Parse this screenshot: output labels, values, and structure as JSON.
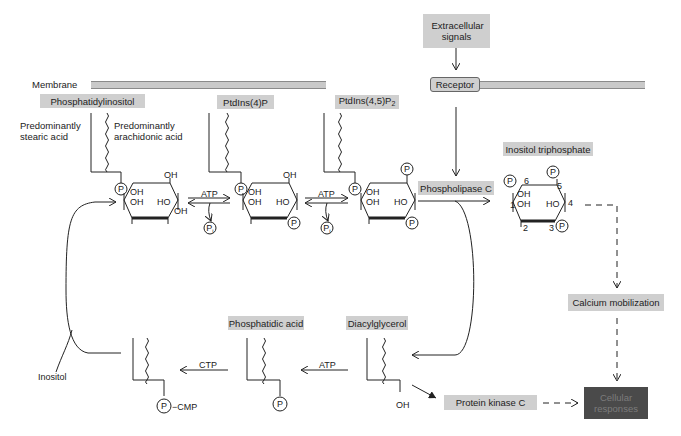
{
  "membrane": {
    "label": "Membrane"
  },
  "extracellular": {
    "label": "Extracellular signals"
  },
  "receptor": {
    "label": "Receptor"
  },
  "molecules": {
    "pi": {
      "label": "Phosphatidylinositol",
      "left_chain": "Predominantly stearic acid",
      "right_chain": "Predominantly arachidonic acid"
    },
    "pip": {
      "label": "PtdIns(4)P"
    },
    "pip2": {
      "label": "PtdIns(4,5)P",
      "subscript": "2"
    },
    "ip3": {
      "label": "Inositol triphosphate",
      "positions": [
        "1",
        "2",
        "3",
        "4",
        "5",
        "6"
      ]
    },
    "phosphatidic_acid": {
      "label": "Phosphatidic acid"
    },
    "diacylglycerol": {
      "label": "Diacylglycerol",
      "oh": "OH"
    },
    "cdp_dag": {
      "p_cmp": "CMP"
    }
  },
  "enzymes": {
    "plc": {
      "label": "Phospholipase C"
    },
    "pkc": {
      "label": "Protein kinase C"
    }
  },
  "outcomes": {
    "calcium": {
      "label": "Calcium mobilization"
    },
    "cellular": {
      "label": "Cellular responses"
    }
  },
  "reaction_labels": {
    "atp1": "ATP",
    "pi1": "Pi",
    "atp2": "ATP",
    "pi2": "Pi",
    "atp3": "ATP",
    "ctp": "CTP",
    "inositol": "Inositol"
  },
  "groups": {
    "P": "P",
    "OH": "OH",
    "HO": "HO"
  },
  "colors": {
    "box": "#cfcfcf",
    "dark_box": "#4a4a4a",
    "line": "#222222",
    "membrane": "#c9c9c9"
  }
}
